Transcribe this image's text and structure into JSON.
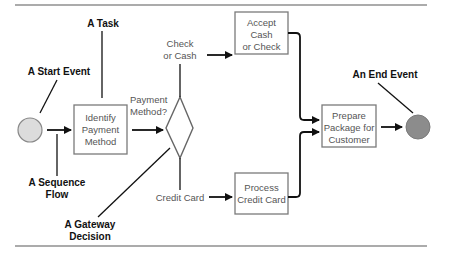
{
  "diagram": {
    "type": "BPMN process",
    "annotations": {
      "task": "A Task",
      "start_event": "A Start Event",
      "sequence_flow_line1": "A Sequence",
      "sequence_flow_line2": "Flow",
      "gateway_line1": "A Gateway",
      "gateway_line2": "Decision",
      "end_event": "An End Event"
    },
    "nodes": {
      "start": {
        "kind": "start-event",
        "fill": "#dcdcdc"
      },
      "identify": {
        "kind": "task",
        "lines": [
          "Identify",
          "Payment",
          "Method"
        ]
      },
      "gateway": {
        "kind": "exclusive-gateway"
      },
      "accept": {
        "kind": "task",
        "lines": [
          "Accept",
          "Cash",
          "or Check"
        ]
      },
      "process": {
        "kind": "task",
        "lines": [
          "Process",
          "Credit Card"
        ]
      },
      "prepare": {
        "kind": "task",
        "lines": [
          "Prepare",
          "Package for",
          "Customer"
        ]
      },
      "end": {
        "kind": "end-event",
        "fill": "#8c8c8c"
      }
    },
    "flow_labels": {
      "payment_line1": "Payment",
      "payment_line2": "Method?",
      "check_line1": "Check",
      "check_line2": "or Cash",
      "credit_card": "Credit Card"
    },
    "edges": [
      {
        "from": "start",
        "to": "identify"
      },
      {
        "from": "identify",
        "to": "gateway",
        "label": "Payment Method?"
      },
      {
        "from": "gateway",
        "to": "accept",
        "label": "Check or Cash"
      },
      {
        "from": "gateway",
        "to": "process",
        "label": "Credit Card"
      },
      {
        "from": "accept",
        "to": "prepare"
      },
      {
        "from": "process",
        "to": "prepare"
      },
      {
        "from": "prepare",
        "to": "end"
      }
    ]
  }
}
